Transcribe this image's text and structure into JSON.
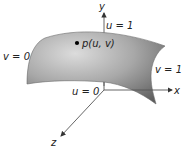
{
  "diagram": {
    "type": "parametric-surface",
    "colors": {
      "surface_light": "#d8d8d8",
      "surface_mid": "#9a9a9a",
      "surface_dark": "#5a5a5a",
      "axis": "#555555",
      "text": "#222222",
      "point": "#000000"
    },
    "axes": {
      "x_label": "x",
      "y_label": "y",
      "z_label": "z"
    },
    "boundary_labels": {
      "u0": "u = 0",
      "u1": "u = 1",
      "v0": "v = 0",
      "v1": "v = 1"
    },
    "point": {
      "label": "p(u, v)"
    }
  }
}
